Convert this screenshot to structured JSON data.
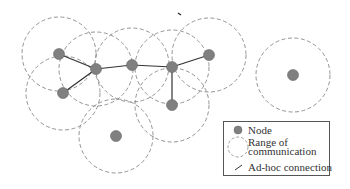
{
  "diagram": {
    "type": "ad-hoc network",
    "node_color": "#808080",
    "range_color": "#888888",
    "connection_color": "#333333",
    "nodes": [
      {
        "id": "n1",
        "x": 59,
        "y": 54
      },
      {
        "id": "n2",
        "x": 96,
        "y": 69
      },
      {
        "id": "n3",
        "x": 132,
        "y": 65
      },
      {
        "id": "n4",
        "x": 172,
        "y": 67
      },
      {
        "id": "n5",
        "x": 209,
        "y": 55
      },
      {
        "id": "n6",
        "x": 63,
        "y": 93
      },
      {
        "id": "n7",
        "x": 172,
        "y": 105
      },
      {
        "id": "n8",
        "x": 116,
        "y": 136
      },
      {
        "id": "n9",
        "x": 293,
        "y": 75
      }
    ],
    "range_radius": 37,
    "connections": [
      [
        "n1",
        "n2"
      ],
      [
        "n6",
        "n2"
      ],
      [
        "n2",
        "n3"
      ],
      [
        "n3",
        "n4"
      ],
      [
        "n4",
        "n5"
      ],
      [
        "n4",
        "n7"
      ]
    ]
  },
  "legend": {
    "node_label": "Node",
    "range_label_line1": "Range of",
    "range_label_line2": "communication",
    "connection_label": "Ad-hoc connection"
  }
}
